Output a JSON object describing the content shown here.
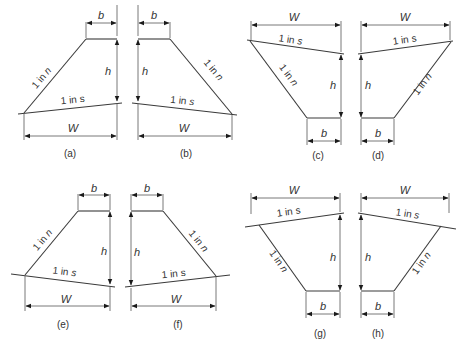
{
  "figure": {
    "labels": {
      "b": "b",
      "h": "h",
      "W": "W",
      "slope_n": "1 in n",
      "slope_s": "1 in s"
    },
    "panels": [
      {
        "id": "a",
        "caption": "(a)"
      },
      {
        "id": "b",
        "caption": "(b)"
      },
      {
        "id": "c",
        "caption": "(c)"
      },
      {
        "id": "d",
        "caption": "(d)"
      },
      {
        "id": "e",
        "caption": "(e)"
      },
      {
        "id": "f",
        "caption": "(f)"
      },
      {
        "id": "g",
        "caption": "(g)"
      },
      {
        "id": "h",
        "caption": "(h)"
      }
    ]
  },
  "colors": {
    "line": "#3a3a3a",
    "text": "#333333",
    "background": "#ffffff"
  }
}
